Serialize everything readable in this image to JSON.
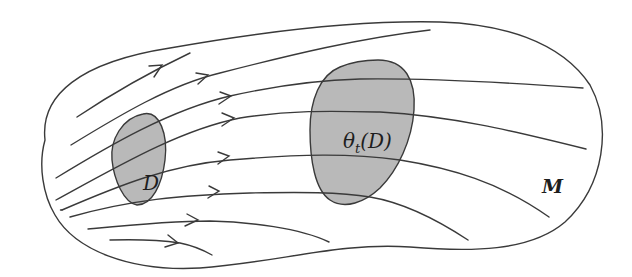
{
  "figure": {
    "labels": {
      "region_initial": "D",
      "region_flowed_theta": "θ",
      "region_flowed_sub": "t",
      "region_flowed_arg": "(D)",
      "manifold": "M"
    },
    "colors": {
      "stroke": "#3a3a3a",
      "region_fill": "#b9b9b9",
      "background": "#ffffff"
    },
    "flow_line_count": 10,
    "arrow_count": 9
  }
}
